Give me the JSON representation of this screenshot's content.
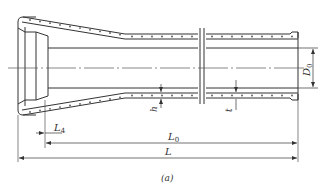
{
  "diagram": {
    "type": "engineering-drawing",
    "caption": "(a)",
    "labels": {
      "D0": {
        "main": "D",
        "sub": "0"
      },
      "h": "h",
      "t": "t",
      "L4": {
        "main": "L",
        "sub": "4"
      },
      "L0": {
        "main": "L",
        "sub": "0"
      },
      "L": "L"
    },
    "colors": {
      "line": "#333333",
      "background": "#ffffff"
    }
  }
}
